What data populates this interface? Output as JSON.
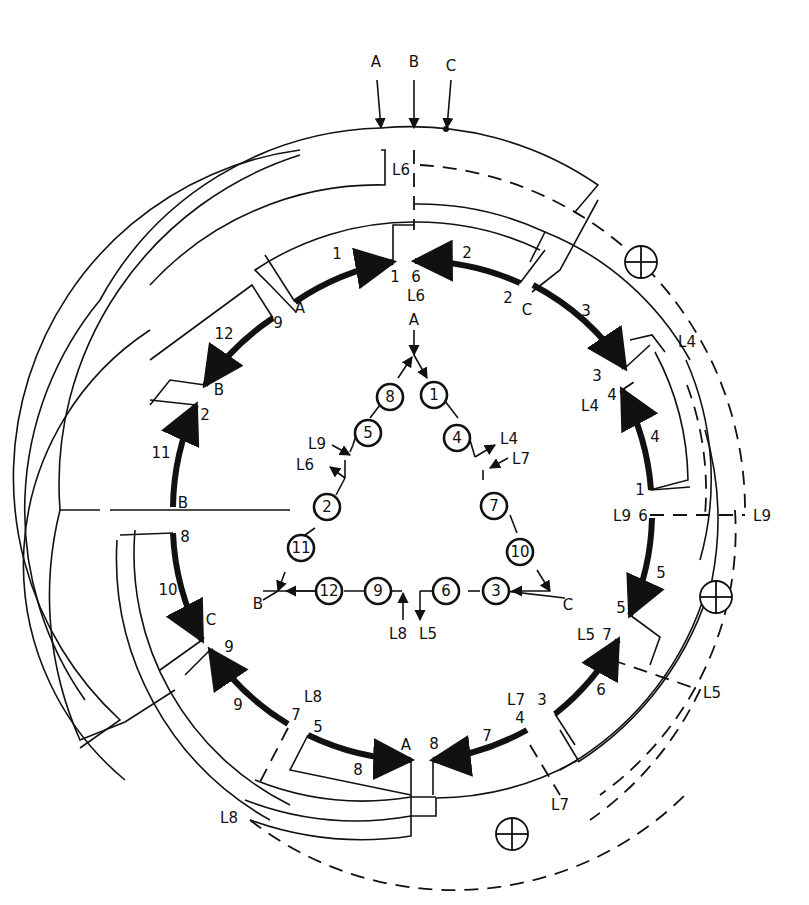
{
  "diagram": {
    "type": "three-phase delta winding connection diagram (12 coil groups, 9 leads)",
    "supply_leads": [
      "A",
      "B",
      "C"
    ],
    "outer_groups": [
      {
        "group": "1",
        "start_label": "A",
        "end_label": "1"
      },
      {
        "group": "2",
        "start_label": "6",
        "end_label": "2",
        "lead": "L6"
      },
      {
        "group": "3",
        "start_label": "C",
        "end_label": "3"
      },
      {
        "group": "4",
        "start_label": "1",
        "end_label": "4",
        "lead": "L4"
      },
      {
        "group": "5",
        "start_label": "6",
        "end_label": "5",
        "lead": "L9"
      },
      {
        "group": "6",
        "start_label": "3",
        "end_label": "7",
        "lead": "L5"
      },
      {
        "group": "7",
        "start_label": "4",
        "end_label": "8",
        "lead": "L7"
      },
      {
        "group": "8",
        "start_label": "5",
        "end_label": "A"
      },
      {
        "group": "9",
        "start_label": "9",
        "end_label": "7",
        "lead": "L8"
      },
      {
        "group": "10",
        "start_label": "8",
        "end_label": "C"
      },
      {
        "group": "11",
        "start_label": "B",
        "end_label": "2"
      },
      {
        "group": "12",
        "start_label": "9",
        "end_label": "B"
      }
    ],
    "lead_labels": [
      "L4",
      "L5",
      "L6",
      "L7",
      "L8",
      "L9"
    ],
    "endpoint_labels": {
      "top": [
        "A",
        "1",
        "6",
        "L6",
        "2",
        "C"
      ],
      "right": [
        "3",
        "4",
        "L4",
        "1",
        "L9",
        "6",
        "5",
        "L5",
        "7"
      ],
      "bottom": [
        "3",
        "4",
        "L7",
        "8",
        "A",
        "5",
        "7",
        "L8"
      ],
      "left": [
        "9",
        "B",
        "2",
        "B",
        "8",
        "C",
        "9"
      ]
    },
    "outer_lead_labels": [
      "L4",
      "L9",
      "L5",
      "L7",
      "L8",
      "L6"
    ],
    "group_numbers": [
      "1",
      "2",
      "3",
      "4",
      "5",
      "6",
      "7",
      "8",
      "9",
      "10",
      "11",
      "12"
    ],
    "junction_symbol": "circle-plus",
    "junction_count": 3
  },
  "schematic": {
    "title_node_top": "A",
    "left_corner": "B",
    "right_corner": "C",
    "left_side_coils": [
      "8",
      "5",
      "2",
      "11"
    ],
    "right_side_coils": [
      "1",
      "4",
      "7",
      "10"
    ],
    "bottom_left_coils": [
      "12",
      "9"
    ],
    "bottom_right_coils": [
      "6",
      "3"
    ],
    "leads": {
      "left_upper_in": "L9",
      "left_upper_out": "L6",
      "right_upper_out": "L4",
      "right_upper_in": "L7",
      "bottom_left": "L8",
      "bottom_right": "L5"
    }
  }
}
